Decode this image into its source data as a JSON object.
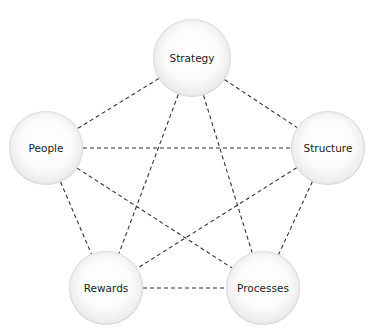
{
  "diagram": {
    "type": "pentagon-network",
    "line_style": "dashed",
    "line_color": "#333333",
    "node_fill": "#f2f2f2",
    "nodes": [
      {
        "id": "strategy",
        "label": "Strategy",
        "cx": 192,
        "cy": 58,
        "r": 39
      },
      {
        "id": "people",
        "label": "People",
        "cx": 46,
        "cy": 148,
        "r": 37
      },
      {
        "id": "structure",
        "label": "Structure",
        "cx": 328,
        "cy": 148,
        "r": 37
      },
      {
        "id": "rewards",
        "label": "Rewards",
        "cx": 106,
        "cy": 288,
        "r": 37
      },
      {
        "id": "processes",
        "label": "Processes",
        "cx": 263,
        "cy": 288,
        "r": 37
      }
    ],
    "edges": [
      [
        "strategy",
        "people"
      ],
      [
        "strategy",
        "structure"
      ],
      [
        "strategy",
        "rewards"
      ],
      [
        "strategy",
        "processes"
      ],
      [
        "people",
        "structure"
      ],
      [
        "people",
        "rewards"
      ],
      [
        "people",
        "processes"
      ],
      [
        "structure",
        "rewards"
      ],
      [
        "structure",
        "processes"
      ],
      [
        "rewards",
        "processes"
      ]
    ]
  }
}
